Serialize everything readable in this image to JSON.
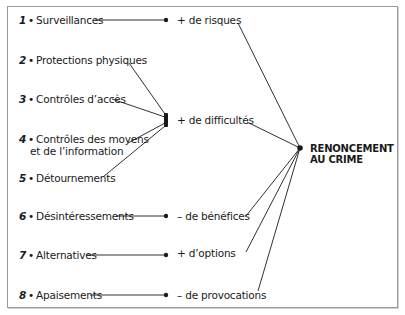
{
  "diagram": {
    "type": "flow-convergence",
    "goal": {
      "line1": "RENONCEMENT",
      "line2": "AU CRIME"
    },
    "techniques": [
      {
        "num": "1",
        "bullet": "•",
        "label": "Surveillances"
      },
      {
        "num": "2",
        "bullet": "•",
        "label": "Protections physiques"
      },
      {
        "num": "3",
        "bullet": "•",
        "label": "Contrôles d’accès"
      },
      {
        "num": "4",
        "bullet": "•",
        "label": "Contrôles des moyens",
        "label2": "et de l’information"
      },
      {
        "num": "5",
        "bullet": "•",
        "label": "Détournements"
      },
      {
        "num": "6",
        "bullet": "•",
        "label": "Désintéressements"
      },
      {
        "num": "7",
        "bullet": "•",
        "label": "Alternatives"
      },
      {
        "num": "8",
        "bullet": "•",
        "label": "Apaisements"
      }
    ],
    "effects": [
      {
        "label": "+ de risques"
      },
      {
        "label": "+ de difficultés"
      },
      {
        "label": "– de bénéfices"
      },
      {
        "label": "+ d’options"
      },
      {
        "label": "– de provocations"
      }
    ],
    "colors": {
      "line": "#1a1a1a",
      "border": "#9a9a9a",
      "text": "#1a1a1a"
    }
  }
}
